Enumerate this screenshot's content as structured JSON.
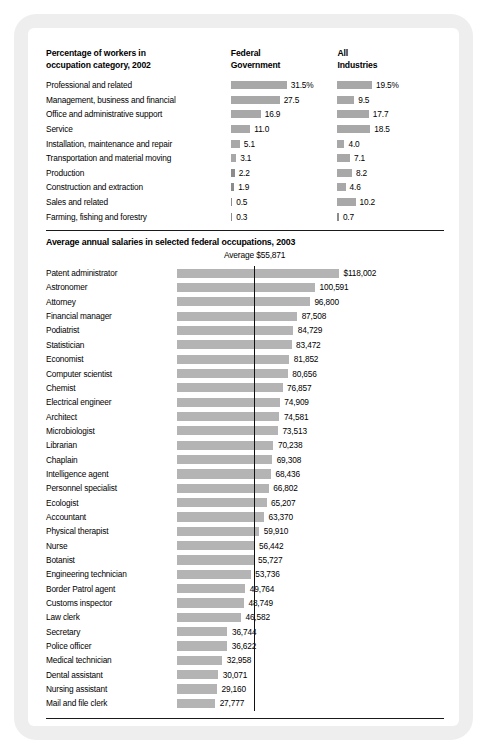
{
  "colors": {
    "bar_gray": "#a8a8a8",
    "bar_gray_salary": "#b4b4b4",
    "rule": "#1a1a1a",
    "card_bg": "#eeeeee",
    "page_bg": "#ffffff",
    "text": "#000000"
  },
  "section1": {
    "title_line1": "Percentage of workers in",
    "title_line2": "occupation category, 2002",
    "col_federal_line1": "Federal",
    "col_federal_line2": "Government",
    "col_all_line1": "All",
    "col_all_line2": "Industries",
    "rows": [
      {
        "label": "Professional and related",
        "federal": 31.5,
        "federal_text": "31.5%",
        "all": 19.5,
        "all_text": "19.5%"
      },
      {
        "label": "Management, business and financial",
        "federal": 27.5,
        "federal_text": "27.5",
        "all": 9.5,
        "all_text": "9.5"
      },
      {
        "label": "Office and administrative support",
        "federal": 16.9,
        "federal_text": "16.9",
        "all": 17.7,
        "all_text": "17.7"
      },
      {
        "label": "Service",
        "federal": 11.0,
        "federal_text": "11.0",
        "all": 18.5,
        "all_text": "18.5"
      },
      {
        "label": "Installation, maintenance and repair",
        "federal": 5.1,
        "federal_text": "5.1",
        "all": 4.0,
        "all_text": "4.0"
      },
      {
        "label": "Transportation and material moving",
        "federal": 3.1,
        "federal_text": "3.1",
        "all": 7.1,
        "all_text": "7.1"
      },
      {
        "label": "Production",
        "federal": 2.2,
        "federal_text": "2.2",
        "all": 8.2,
        "all_text": "8.2"
      },
      {
        "label": "Construction and extraction",
        "federal": 1.9,
        "federal_text": "1.9",
        "all": 4.6,
        "all_text": "4.6"
      },
      {
        "label": "Sales and related",
        "federal": 0.5,
        "federal_text": "0.5",
        "all": 10.2,
        "all_text": "10.2"
      },
      {
        "label": "Farming, fishing and forestry",
        "federal": 0.3,
        "federal_text": "0.3",
        "all": 0.7,
        "all_text": "0.7"
      }
    ]
  },
  "section2": {
    "title": "Average annual salaries in selected federal occupations, 2003",
    "average_label": "Average $55,871",
    "average_value": 55871,
    "rows": [
      {
        "label": "Patent administrator",
        "value": 118002,
        "value_text": "$118,002"
      },
      {
        "label": "Astronomer",
        "value": 100591,
        "value_text": "100,591"
      },
      {
        "label": "Attorney",
        "value": 96800,
        "value_text": "96,800"
      },
      {
        "label": "Financial manager",
        "value": 87508,
        "value_text": "87,508"
      },
      {
        "label": "Podiatrist",
        "value": 84729,
        "value_text": "84,729"
      },
      {
        "label": "Statistician",
        "value": 83472,
        "value_text": "83,472"
      },
      {
        "label": "Economist",
        "value": 81852,
        "value_text": "81,852"
      },
      {
        "label": "Computer scientist",
        "value": 80656,
        "value_text": "80,656"
      },
      {
        "label": "Chemist",
        "value": 76857,
        "value_text": "76,857"
      },
      {
        "label": "Electrical engineer",
        "value": 74909,
        "value_text": "74,909"
      },
      {
        "label": "Architect",
        "value": 74581,
        "value_text": "74,581"
      },
      {
        "label": "Microbiologist",
        "value": 73513,
        "value_text": "73,513"
      },
      {
        "label": "Librarian",
        "value": 70238,
        "value_text": "70,238"
      },
      {
        "label": "Chaplain",
        "value": 69308,
        "value_text": "69,308"
      },
      {
        "label": "Intelligence agent",
        "value": 68436,
        "value_text": "68,436"
      },
      {
        "label": "Personnel specialist",
        "value": 66802,
        "value_text": "66,802"
      },
      {
        "label": "Ecologist",
        "value": 65207,
        "value_text": "65,207"
      },
      {
        "label": "Accountant",
        "value": 63370,
        "value_text": "63,370"
      },
      {
        "label": "Physical therapist",
        "value": 59910,
        "value_text": "59,910"
      },
      {
        "label": "Nurse",
        "value": 56442,
        "value_text": "56,442"
      },
      {
        "label": "Botanist",
        "value": 55727,
        "value_text": "55,727"
      },
      {
        "label": "Engineering technician",
        "value": 53736,
        "value_text": "53,736"
      },
      {
        "label": "Border Patrol agent",
        "value": 49764,
        "value_text": "49,764"
      },
      {
        "label": "Customs inspector",
        "value": 48749,
        "value_text": "48,749"
      },
      {
        "label": "Law clerk",
        "value": 46582,
        "value_text": "46,582"
      },
      {
        "label": "Secretary",
        "value": 36744,
        "value_text": "36,744"
      },
      {
        "label": "Police officer",
        "value": 36622,
        "value_text": "36,622"
      },
      {
        "label": "Medical technician",
        "value": 32958,
        "value_text": "32,958"
      },
      {
        "label": "Dental assistant",
        "value": 30071,
        "value_text": "30,071"
      },
      {
        "label": "Nursing assistant",
        "value": 29160,
        "value_text": "29,160"
      },
      {
        "label": "Mail and file clerk",
        "value": 27777,
        "value_text": "27,777"
      }
    ]
  },
  "chart_data": [
    {
      "type": "bar",
      "title": "Percentage of workers in occupation category, 2002",
      "orientation": "horizontal",
      "categories": [
        "Professional and related",
        "Management, business and financial",
        "Office and administrative support",
        "Service",
        "Installation, maintenance and repair",
        "Transportation and material moving",
        "Production",
        "Construction and extraction",
        "Sales and related",
        "Farming, fishing and forestry"
      ],
      "series": [
        {
          "name": "Federal Government",
          "values": [
            31.5,
            27.5,
            16.9,
            11.0,
            5.1,
            3.1,
            2.2,
            1.9,
            0.5,
            0.3
          ]
        },
        {
          "name": "All Industries",
          "values": [
            19.5,
            9.5,
            17.7,
            18.5,
            4.0,
            7.1,
            8.2,
            4.6,
            10.2,
            0.7
          ]
        }
      ],
      "xlabel": "Percent",
      "ylabel": "",
      "xlim": [
        0,
        31.5
      ],
      "grid": false,
      "legend": "column-headers"
    },
    {
      "type": "bar",
      "title": "Average annual salaries in selected federal occupations, 2003",
      "orientation": "horizontal",
      "categories": [
        "Patent administrator",
        "Astronomer",
        "Attorney",
        "Financial manager",
        "Podiatrist",
        "Statistician",
        "Economist",
        "Computer scientist",
        "Chemist",
        "Electrical engineer",
        "Architect",
        "Microbiologist",
        "Librarian",
        "Chaplain",
        "Intelligence agent",
        "Personnel specialist",
        "Ecologist",
        "Accountant",
        "Physical therapist",
        "Nurse",
        "Botanist",
        "Engineering technician",
        "Border Patrol agent",
        "Customs inspector",
        "Law clerk",
        "Secretary",
        "Police officer",
        "Medical technician",
        "Dental assistant",
        "Nursing assistant",
        "Mail and file clerk"
      ],
      "values": [
        118002,
        100591,
        96800,
        87508,
        84729,
        83472,
        81852,
        80656,
        76857,
        74909,
        74581,
        73513,
        70238,
        69308,
        68436,
        66802,
        65207,
        63370,
        59910,
        56442,
        55727,
        53736,
        49764,
        48749,
        46582,
        36744,
        36622,
        32958,
        30071,
        29160,
        27777
      ],
      "xlabel": "Average annual salary (USD)",
      "ylabel": "",
      "xlim": [
        0,
        118002
      ],
      "grid": false,
      "annotations": [
        {
          "type": "vline",
          "value": 55871,
          "label": "Average $55,871"
        }
      ]
    }
  ]
}
